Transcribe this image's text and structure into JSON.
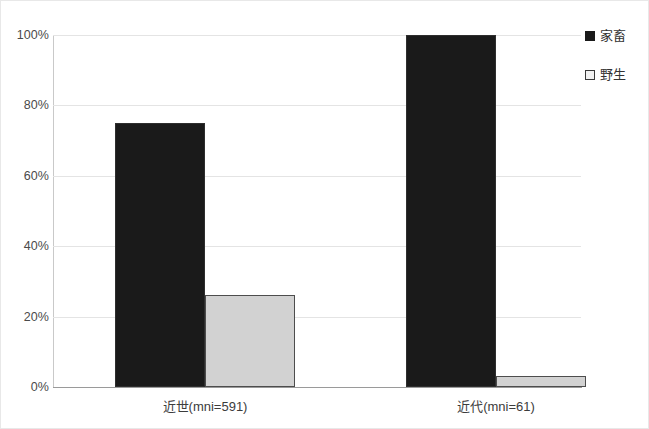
{
  "chart_data": {
    "type": "bar",
    "title": "",
    "subtitle": "",
    "xlabel": "",
    "ylabel": "",
    "categories": [
      "近世(mni=591)",
      "近代(mni=61)"
    ],
    "series": [
      {
        "name": "家畜",
        "values": [
          75,
          100
        ],
        "color": "#1a1a1a"
      },
      {
        "name": "野生",
        "values": [
          26,
          3
        ],
        "color": "#d2d2d2"
      }
    ],
    "ylim": [
      0,
      100
    ],
    "y_ticks": [
      0,
      20,
      40,
      60,
      80,
      100
    ],
    "y_tick_labels": [
      "0%",
      "20%",
      "40%",
      "60%",
      "80%",
      "100%"
    ],
    "grid": true,
    "legend_position": "right",
    "legend": [
      {
        "label": "家畜",
        "marker": "filled-square"
      },
      {
        "label": "野生",
        "marker": "outlined-square"
      }
    ]
  },
  "axes": {
    "y_tick_labels": [
      "100%",
      "80%",
      "60%",
      "40%",
      "20%",
      "0%"
    ]
  }
}
